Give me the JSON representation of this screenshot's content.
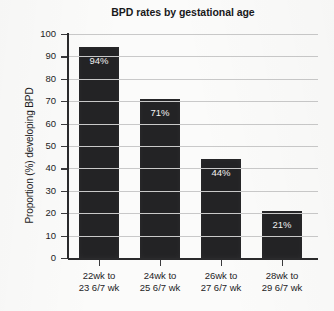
{
  "chart_data": {
    "type": "bar",
    "title": "BPD rates by gestational age",
    "xlabel": "",
    "ylabel": "Proportion (%) developing BPD",
    "categories": [
      "22wk to 23 6/7 wk",
      "24wk to 25 6/7 wk",
      "26wk to 27 6/7 wk",
      "28wk to 29 6/7 wk"
    ],
    "category_lines": [
      [
        "22wk to",
        "23 6/7 wk"
      ],
      [
        "24wk to",
        "25 6/7 wk"
      ],
      [
        "26wk to",
        "27 6/7 wk"
      ],
      [
        "28wk to",
        "29 6/7 wk"
      ]
    ],
    "values": [
      94,
      71,
      44,
      21
    ],
    "value_labels": [
      "94%",
      "71%",
      "44%",
      "21%"
    ],
    "ylim": [
      0,
      100
    ],
    "yticks": [
      0,
      10,
      20,
      30,
      40,
      50,
      60,
      70,
      80,
      90,
      100
    ],
    "ytick_labels": [
      "0",
      "10",
      "20",
      "30",
      "40",
      "50",
      "60",
      "70",
      "80",
      "90",
      "100"
    ],
    "grid": true,
    "legend": null,
    "bar_color": "#232325",
    "grid_color": "#c9c9c9",
    "axis_color": "#2a2a2c",
    "value_label_color": "#f2f2f2",
    "background_color": "#fbfbfa"
  }
}
